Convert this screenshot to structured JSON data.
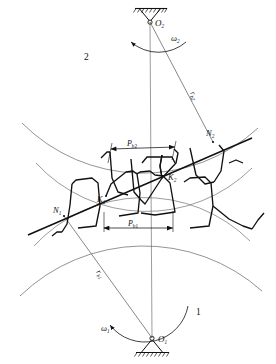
{
  "figure": {
    "type": "mechanical-engineering-diagram",
    "background_color": "#ffffff",
    "line_color": "#111111",
    "thin_line_color": "#555555"
  },
  "labels": {
    "gear1_number": "1",
    "gear2_number": "2",
    "center_lower": "O",
    "center_lower_sub": "1",
    "center_upper": "O",
    "center_upper_sub": "2",
    "omega_lower": "ω",
    "omega_lower_sub": "1",
    "omega_upper": "ω",
    "omega_upper_sub": "2",
    "tangent_point_lower": "N",
    "tangent_point_lower_sub": "1",
    "tangent_point_upper": "N",
    "tangent_point_upper_sub": "2",
    "contact_point_lower": "K",
    "contact_point_lower_sub": "1",
    "contact_point_upper": "K",
    "contact_point_upper_sub": "2",
    "base_radius_lower": "r",
    "base_radius_lower_sub": "b1",
    "base_radius_upper": "r",
    "base_radius_upper_sub": "b2",
    "base_pitch_lower": "P",
    "base_pitch_lower_sub": "b1",
    "base_pitch_upper": "P",
    "base_pitch_upper_sub": "b2"
  },
  "geometry": {
    "center_lower_xy": [
      152,
      338
    ],
    "center_upper_xy": [
      150,
      22
    ],
    "tangent_lower_xy": [
      64,
      216
    ],
    "tangent_upper_xy": [
      213,
      142
    ],
    "contact_lower_xy": [
      106,
      196
    ],
    "contact_upper_xy": [
      163,
      176
    ],
    "base_pitch_upper_span": [
      110,
      174
    ],
    "base_pitch_lower_span": [
      103,
      172
    ],
    "base_pitch_upper_y": 149,
    "base_pitch_lower_y": 228
  }
}
